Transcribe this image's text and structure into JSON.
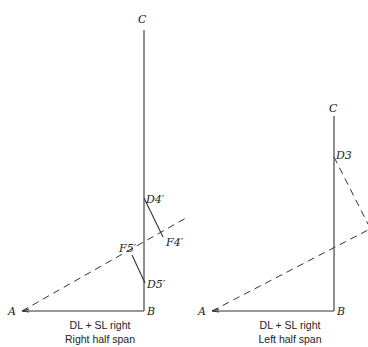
{
  "diagrams": [
    {
      "id": "right-half-span",
      "caption": [
        "DL + SL right",
        "Right half span"
      ],
      "points": {
        "C": "C",
        "A": "A",
        "B": "B",
        "D4": "D4′",
        "F4": "F4′",
        "F5": "F5′",
        "D5": "D5′"
      }
    },
    {
      "id": "left-half-span",
      "caption": [
        "DL + SL right",
        "Left half span"
      ],
      "points": {
        "C": "C",
        "A": "A",
        "B": "B",
        "D3": "D3"
      }
    }
  ]
}
